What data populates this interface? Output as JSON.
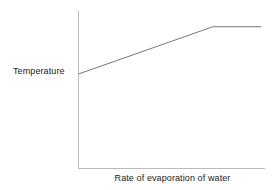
{
  "chart_data": {
    "type": "line",
    "title": "",
    "subtitle": "",
    "xlabel": "Rate of evaporation of water",
    "ylabel": "Temperature",
    "grid": false,
    "legend": null,
    "axis_ticks": {
      "x": [],
      "y": []
    },
    "axis_arrows": false,
    "xlim": [
      0,
      100
    ],
    "ylim": [
      0,
      100
    ],
    "series": [
      {
        "name": "Temperature vs rate of evaporation",
        "x": [
          0,
          72,
          98
        ],
        "y": [
          60,
          90,
          90
        ],
        "description": "Temperature rises linearly with rate of evaporation of water, then levels off at a plateau.",
        "color": "#777777",
        "width": 1
      }
    ]
  },
  "figure": {
    "background_color": "#ffffff",
    "axis_color": "#bbbbbb",
    "line_color": "#777777",
    "text_color": "#222222",
    "width": 277,
    "height": 190
  },
  "labels": {
    "y_axis": "Temperature",
    "x_axis": "Rate of evaporation of water"
  }
}
